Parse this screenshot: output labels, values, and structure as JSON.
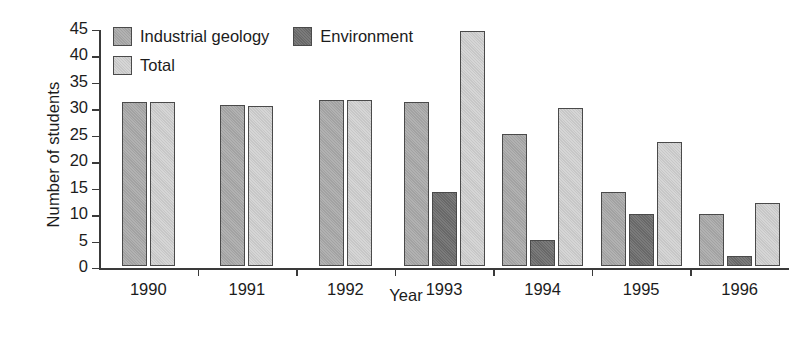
{
  "chart_data": {
    "type": "bar",
    "title": "",
    "xlabel": "Year",
    "ylabel": "Number of students",
    "categories": [
      "1990",
      "1991",
      "1992",
      "1993",
      "1994",
      "1995",
      "1996"
    ],
    "ylim": [
      0,
      45
    ],
    "yticks": [
      0,
      5,
      10,
      15,
      20,
      25,
      30,
      35,
      40,
      45
    ],
    "ytick_labels": [
      "0",
      "5",
      "10",
      "15",
      "20",
      "25",
      "30",
      "35",
      "40",
      "45"
    ],
    "grid": false,
    "legend_position": "top-left",
    "series": [
      {
        "name": "Industrial geology",
        "color": "#a9a9a9",
        "values": [
          31,
          30.5,
          31.5,
          31,
          25,
          14,
          10
        ]
      },
      {
        "name": "Environment",
        "color": "#6e6e6e",
        "values": [
          null,
          null,
          null,
          14,
          5,
          10,
          2
        ]
      },
      {
        "name": "Total",
        "color": "#cfcfcf",
        "values": [
          31,
          30.3,
          31.5,
          44.5,
          30,
          23.5,
          12
        ]
      }
    ]
  },
  "legend": {
    "entries": [
      {
        "label": "Industrial geology",
        "key": "industrial"
      },
      {
        "label": "Environment",
        "key": "environment"
      },
      {
        "label": "Total",
        "key": "total"
      }
    ]
  },
  "axes": {
    "y_title": "Number of students",
    "x_title": "Year"
  }
}
